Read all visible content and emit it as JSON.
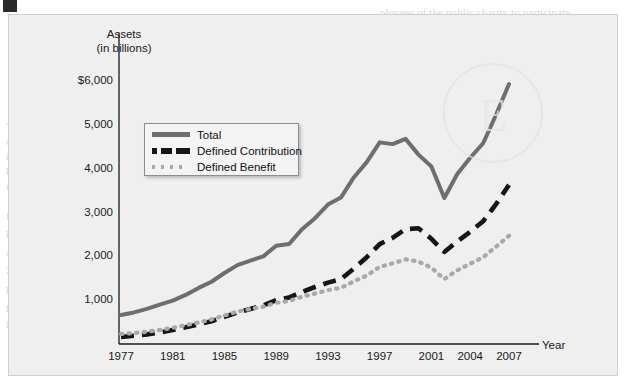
{
  "figure": {
    "corner_mark": "figure-corner-mark",
    "watermark_letter": "E"
  },
  "chart_data": {
    "type": "line",
    "title": "",
    "ylabel_line1": "Assets",
    "ylabel_line2": "(in billions)",
    "xlabel": "Year",
    "grid": false,
    "legend_position": "inside-upper-left",
    "xlim": [
      1977,
      2007
    ],
    "ylim": [
      0,
      6250
    ],
    "ytick_labels": [
      "$6,000",
      "5,000",
      "4,000",
      "3,000",
      "2,000",
      "1,000"
    ],
    "ytick_values": [
      6000,
      5000,
      4000,
      3000,
      2000,
      1000
    ],
    "xtick_labels": [
      "1977",
      "1981",
      "1985",
      "1989",
      "1993",
      "1997",
      "2001",
      "2004",
      "2007"
    ],
    "xtick_values": [
      1977,
      1981,
      1985,
      1989,
      1993,
      1997,
      2001,
      2004,
      2007
    ],
    "x": [
      1977,
      1978,
      1979,
      1980,
      1981,
      1982,
      1983,
      1984,
      1985,
      1986,
      1987,
      1988,
      1989,
      1990,
      1991,
      1992,
      1993,
      1994,
      1995,
      1996,
      1997,
      1998,
      1999,
      2000,
      2001,
      2002,
      2003,
      2004,
      2005,
      2006,
      2007
    ],
    "series": [
      {
        "name": "Total",
        "style": "solid",
        "color": "#6e6e6e",
        "values": [
          660,
          720,
          800,
          900,
          990,
          1120,
          1280,
          1420,
          1620,
          1800,
          1900,
          2000,
          2240,
          2280,
          2620,
          2870,
          3180,
          3340,
          3800,
          4150,
          4600,
          4560,
          4680,
          4320,
          4050,
          3330,
          3880,
          4250,
          4580,
          5230,
          5930
        ]
      },
      {
        "name": "Defined Contribution",
        "style": "dashed",
        "color": "#151515",
        "values": [
          160,
          190,
          220,
          260,
          320,
          380,
          450,
          520,
          620,
          720,
          800,
          880,
          1000,
          1060,
          1190,
          1300,
          1400,
          1480,
          1720,
          1980,
          2280,
          2420,
          2620,
          2640,
          2400,
          2100,
          2340,
          2560,
          2800,
          3190,
          3630
        ]
      },
      {
        "name": "Defined Benefit",
        "style": "dotted",
        "color": "#a9a9a9",
        "values": [
          230,
          250,
          280,
          320,
          370,
          430,
          490,
          560,
          650,
          740,
          800,
          850,
          940,
          980,
          1080,
          1150,
          1230,
          1280,
          1430,
          1560,
          1760,
          1840,
          1930,
          1880,
          1740,
          1480,
          1680,
          1830,
          1980,
          2220,
          2470
        ]
      }
    ]
  },
  "bleed_text": [
    {
      "x": 380,
      "y": 6,
      "size": 11,
      "text": "ployees of the public charity to participate"
    },
    {
      "x": 30,
      "y": 40,
      "size": 11,
      "text": "types of Private Pension Funds. Private defined benefit and defined contribution pen"
    },
    {
      "x": 22,
      "y": 55,
      "size": 11,
      "text": "sion plans cover in select types Employees to participate in 401(k), 403(b), and 409(b) plans,"
    },
    {
      "x": 96,
      "y": 70,
      "size": 11,
      "text": "individual retirement accounts (IRAs) and similar accounts."
    },
    {
      "x": 410,
      "y": 108,
      "size": 11,
      "text": "401(k) and 403(b) plans"
    },
    {
      "x": 410,
      "y": 123,
      "size": 11,
      "text": "employer-sponsored plan that"
    },
    {
      "x": 410,
      "y": 138,
      "size": 11,
      "text": "supplements are often tax-free"
    },
    {
      "x": 410,
      "y": 153,
      "size": 11,
      "text": "plan participants in 401(k)"
    },
    {
      "x": 6,
      "y": 120,
      "size": 11,
      "text": "The most"
    },
    {
      "x": 6,
      "y": 135,
      "size": 11,
      "text": "common type"
    },
    {
      "x": 6,
      "y": 150,
      "size": 11,
      "text": "is a mixture of"
    },
    {
      "x": 6,
      "y": 165,
      "size": 11,
      "text": "both types"
    },
    {
      "x": 6,
      "y": 180,
      "size": 11,
      "text": "represents"
    },
    {
      "x": 6,
      "y": 210,
      "size": 11,
      "text": "Figure 18-5"
    },
    {
      "x": 6,
      "y": 228,
      "size": 11,
      "text": "by the growth"
    },
    {
      "x": 6,
      "y": 246,
      "size": 11,
      "text": "assets of"
    },
    {
      "x": 6,
      "y": 264,
      "size": 11,
      "text": "2000 to"
    },
    {
      "x": 6,
      "y": 282,
      "size": 11,
      "text": "private"
    },
    {
      "x": 6,
      "y": 300,
      "size": 11,
      "text": "plans"
    },
    {
      "x": 6,
      "y": 318,
      "size": 11,
      "text": "December 2007"
    },
    {
      "x": 150,
      "y": 118,
      "size": 11,
      "text": "and these are employer-sponsored plan that"
    },
    {
      "x": 150,
      "y": 133,
      "size": 11,
      "text": "employer and employee con-"
    },
    {
      "x": 150,
      "y": 148,
      "size": 11,
      "text": "TIAA CREF, 401(k)"
    },
    {
      "x": 150,
      "y": 163,
      "size": 11,
      "text": "plans and employees of"
    },
    {
      "x": 150,
      "y": 178,
      "size": 11,
      "text": "institution). Contributing"
    },
    {
      "x": 150,
      "y": 193,
      "size": 11,
      "text": "the employee's taxable salary"
    },
    {
      "x": 150,
      "y": 208,
      "size": 11,
      "text": "percentage of the employee's salary"
    },
    {
      "x": 150,
      "y": 223,
      "size": 11,
      "text": "contributions and earnings then"
    },
    {
      "x": 150,
      "y": 238,
      "size": 11,
      "text": "plans are transferable to another"
    },
    {
      "x": 150,
      "y": 253,
      "size": 11,
      "text": "changes jobs. Figure 18-5 shows the"
    },
    {
      "x": 150,
      "y": 268,
      "size": 11,
      "text": "(2%) to $5,975 billion in 2007,"
    },
    {
      "x": 150,
      "y": 283,
      "size": 11,
      "text": "million plan participants"
    },
    {
      "x": 150,
      "y": 298,
      "size": 11,
      "text": "their own more of the allo-"
    },
    {
      "x": 150,
      "y": 313,
      "size": 11,
      "text": "cation the choice among"
    }
  ],
  "legend": {
    "items": [
      {
        "label": "Total",
        "swatch": "solid-line-swatch"
      },
      {
        "label": "Defined Contribution",
        "swatch": "dashed-line-swatch"
      },
      {
        "label": "Defined Benefit",
        "swatch": "dotted-line-swatch"
      }
    ]
  }
}
